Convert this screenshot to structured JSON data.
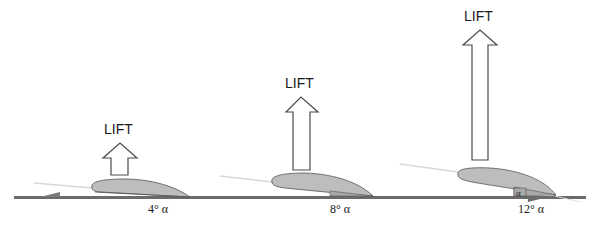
{
  "diagram": {
    "title": "",
    "colors": {
      "ground": "#6b6b6b",
      "airfoil_fill": "#bdbdbd",
      "airfoil_stroke": "#555555",
      "arrow_stroke": "#4a4a4a",
      "airflow_line": "#d8d8d8",
      "text": "#1a1a1a"
    },
    "panels": [
      {
        "lift_label": "LIFT",
        "angle_label": "4° α",
        "angle_deg": 4,
        "lift_size": "small"
      },
      {
        "lift_label": "LIFT",
        "angle_label": "8° α",
        "angle_deg": 8,
        "lift_size": "medium"
      },
      {
        "lift_label": "LIFT",
        "angle_label": "12° α",
        "angle_deg": 12,
        "lift_size": "large",
        "angle_marker": "α"
      }
    ]
  }
}
